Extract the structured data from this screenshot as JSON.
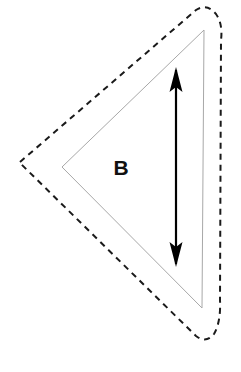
{
  "figure": {
    "canvas": {
      "width": 241,
      "height": 372,
      "background": "#ffffff"
    },
    "title": "",
    "region_label": "B",
    "shapes": {
      "inner_triangle": {
        "name": "solid-triangle",
        "line_style": "solid",
        "stroke_color": "#a8a8a8",
        "stroke_width": 1,
        "fill": "none",
        "points": "204,30 62,167 202,308",
        "vertices": [
          {
            "label": "top-right",
            "x": 204,
            "y": 30
          },
          {
            "label": "left",
            "x": 62,
            "y": 167
          },
          {
            "label": "bottom-right",
            "x": 202,
            "y": 308
          }
        ]
      },
      "outer_boundary": {
        "name": "dashed-offset-outline",
        "line_style": "dashed",
        "stroke_color": "#1a1a1a",
        "stroke_width": 2,
        "dash_pattern": "6 5",
        "fill": "none",
        "path": "M 20 162 L 196 10 Q 207 3 216 14 Q 223 24 221 40 L 220 300 Q 221 322 214 334 Q 206 344 196 336 L 20 163 Z"
      }
    },
    "annotations": {
      "dimension_arrow": {
        "name": "double-headed-arrow",
        "orientation": "vertical",
        "color": "#000000",
        "shaft_width": 2,
        "x": 176,
        "y_top": 68,
        "y_bottom": 266,
        "head_length": 24,
        "head_half_width": 6.5
      },
      "label_b": {
        "name": "region-label-b",
        "text": "B",
        "x": 121,
        "y": 168,
        "color": "#111111",
        "font_size": 21,
        "font_weight": "bold"
      }
    }
  }
}
